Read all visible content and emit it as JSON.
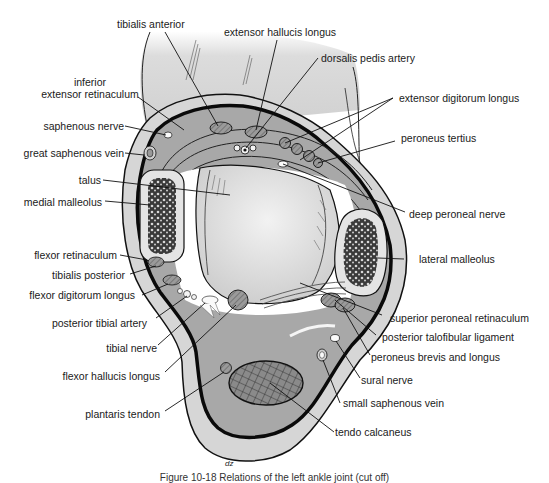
{
  "diagram": {
    "type": "anatomical-cross-section",
    "colors": {
      "skin": "#d9d9d9",
      "compartment": "#a9a9a9",
      "bone_shell": "#e6e6e6",
      "outline": "#111111",
      "background": "#ffffff"
    },
    "labels_left": [
      {
        "id": "inferior-extensor-retinaculum",
        "text_line1": "inferior",
        "text_line2": "extensor retinaculum"
      },
      {
        "id": "saphenous-nerve",
        "text": "saphenous nerve"
      },
      {
        "id": "great-saphenous-vein",
        "text": "great saphenous vein"
      },
      {
        "id": "talus",
        "text": "talus"
      },
      {
        "id": "medial-malleolus",
        "text": "medial malleolus"
      },
      {
        "id": "flexor-retinaculum",
        "text": "flexor retinaculum"
      },
      {
        "id": "tibialis-posterior",
        "text": "tibialis posterior"
      },
      {
        "id": "flexor-digitorum-longus",
        "text": "flexor digitorum longus"
      },
      {
        "id": "posterior-tibial-artery",
        "text": "posterior tibial artery"
      },
      {
        "id": "tibial-nerve",
        "text": "tibial nerve"
      },
      {
        "id": "flexor-hallucis-longus",
        "text": "flexor hallucis longus"
      },
      {
        "id": "plantaris-tendon",
        "text": "plantaris tendon"
      }
    ],
    "labels_top": [
      {
        "id": "tibialis-anterior",
        "text": "tibialis anterior"
      },
      {
        "id": "extensor-hallucis-longus",
        "text": "extensor hallucis longus"
      },
      {
        "id": "dorsalis-pedis-artery",
        "text": "dorsalis pedis artery"
      }
    ],
    "labels_right": [
      {
        "id": "extensor-digitorum-longus",
        "text": "extensor digitorum longus"
      },
      {
        "id": "peroneus-tertius",
        "text": "peroneus tertius"
      },
      {
        "id": "deep-peroneal-nerve",
        "text": "deep peroneal nerve"
      },
      {
        "id": "lateral-malleolus",
        "text": "lateral malleolus"
      },
      {
        "id": "superior-peroneal-retinaculum",
        "text": "superior peroneal retinaculum"
      },
      {
        "id": "posterior-talofibular-ligament",
        "text": "posterior talofibular ligament"
      },
      {
        "id": "peroneus-brevis-and-longus",
        "text": "peroneus brevis and longus"
      },
      {
        "id": "sural-nerve",
        "text": "sural nerve"
      },
      {
        "id": "small-saphenous-vein",
        "text": "small saphenous vein"
      },
      {
        "id": "tendo-calcaneus",
        "text": "tendo calcaneus"
      }
    ],
    "artist_signature": "dz",
    "caption": "Figure 10-18 Relations of the left ankle joint (cut off)"
  }
}
